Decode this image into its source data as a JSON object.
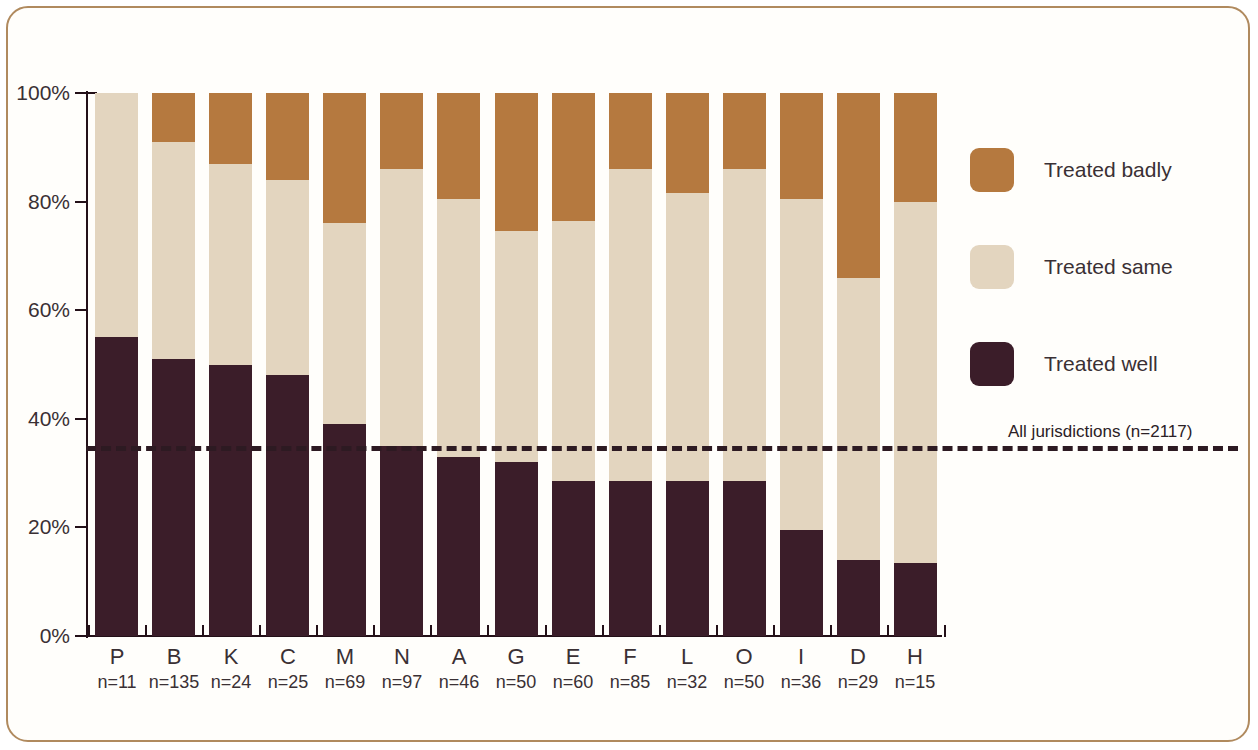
{
  "chart_data": {
    "type": "bar",
    "subtype": "stacked-100-percent",
    "title": "",
    "xlabel": "",
    "ylabel": "",
    "ylim": [
      0,
      100
    ],
    "ytick_labels": [
      "0%",
      "20%",
      "40%",
      "60%",
      "80%",
      "100%"
    ],
    "ytick_values": [
      0,
      20,
      40,
      60,
      80,
      100
    ],
    "grid": false,
    "legend_position": "right",
    "stack_order_bottom_to_top": [
      "Treated well",
      "Treated same",
      "Treated badly"
    ],
    "categories": [
      "P",
      "B",
      "K",
      "C",
      "M",
      "N",
      "A",
      "G",
      "E",
      "F",
      "L",
      "O",
      "I",
      "D",
      "H"
    ],
    "category_sublabels": [
      "n=11",
      "n=135",
      "n=24",
      "n=25",
      "n=69",
      "n=97",
      "n=46",
      "n=50",
      "n=60",
      "n=85",
      "n=32",
      "n=50",
      "n=36",
      "n=29",
      "n=15"
    ],
    "category_n": [
      11,
      135,
      24,
      25,
      69,
      97,
      46,
      50,
      60,
      85,
      32,
      50,
      36,
      29,
      15
    ],
    "series": [
      {
        "name": "Treated well",
        "color": "#3b1d29",
        "values": [
          55,
          51,
          50,
          48,
          39,
          35,
          33,
          32,
          28.5,
          28.5,
          28.5,
          28.5,
          19.5,
          14,
          13.5
        ]
      },
      {
        "name": "Treated same",
        "color": "#e3d5bf",
        "values": [
          45,
          40,
          37,
          36,
          37,
          51,
          47.5,
          42.5,
          48,
          57.5,
          53,
          57.5,
          61,
          52,
          66.5
        ]
      },
      {
        "name": "Treated badly",
        "color": "#b5793f",
        "values": [
          0,
          9,
          13,
          16,
          24,
          14,
          19.5,
          25.5,
          23.5,
          14,
          18.5,
          14,
          19.5,
          34,
          20
        ]
      }
    ],
    "reference_line": {
      "label": "All jurisdictions (n=2117)",
      "value": 35,
      "n": 2117,
      "style": "dashed",
      "color": "#2d1a22"
    }
  },
  "legend": {
    "items": [
      {
        "label": "Treated badly",
        "color": "#b5793f"
      },
      {
        "label": "Treated same",
        "color": "#e3d5bf"
      },
      {
        "label": "Treated well",
        "color": "#3b1d29"
      }
    ]
  },
  "colors": {
    "treated_well": "#3b1d29",
    "treated_same": "#e3d5bf",
    "treated_badly": "#b5793f",
    "frame_border": "#b08a5e",
    "axis": "#231018",
    "text": "#3a3034",
    "background": "#fffefb"
  }
}
